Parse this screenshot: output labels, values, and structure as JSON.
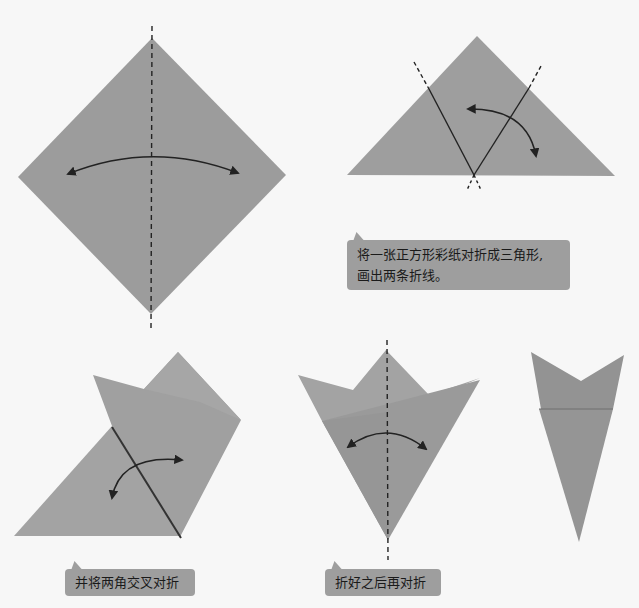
{
  "colors": {
    "background": "#f7f7f7",
    "paper": "#9c9c9c",
    "paper_light": "#a8a8a8",
    "paper_dark": "#8f8f8f",
    "line": "#222222",
    "bubble": "#9e9e9e"
  },
  "steps": [
    {
      "id": 1,
      "figure": "square paper rotated as diamond with vertical dashed fold line and bidirectional arc arrow"
    },
    {
      "id": 2,
      "figure": "triangle with two slanted crease lines forming a V and a curved arrow",
      "caption_lines": [
        "将一张正方形彩纸对折成三角形,",
        "画出两条折线。"
      ]
    },
    {
      "id": 3,
      "figure": "triangle with corners being crossed over",
      "caption_lines": [
        "并将两角交叉对折"
      ]
    },
    {
      "id": 4,
      "figure": "cone shape with vertical dashed fold line and arc arrow",
      "caption_lines": [
        "折好之后再对折"
      ]
    },
    {
      "id": 5,
      "figure": "final folded narrow cone with notched top"
    }
  ]
}
